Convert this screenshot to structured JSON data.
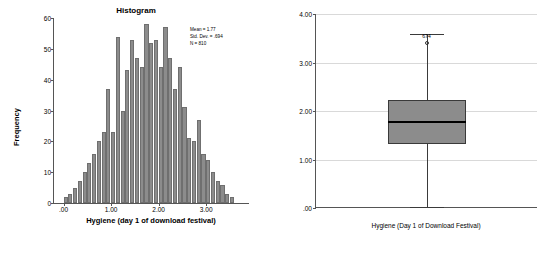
{
  "chart_data": [
    {
      "type": "bar",
      "name": "histogram",
      "title": "Histogram",
      "xlabel": "Hygiene (day 1 of download festival)",
      "ylabel": "Frequency",
      "xlim": [
        -0.2,
        3.9
      ],
      "ylim": [
        0,
        60
      ],
      "yticks": [
        "0",
        "10",
        "20",
        "30",
        "40",
        "50",
        "60"
      ],
      "ytickvals": [
        0,
        10,
        20,
        30,
        40,
        50,
        60
      ],
      "xticks": [
        ".00",
        "1.00",
        "2.00",
        "3.00"
      ],
      "xtickvals": [
        0,
        1,
        2,
        3
      ],
      "grid": false,
      "bin_width": 0.1,
      "bin_starts": [
        0.0,
        0.1,
        0.2,
        0.3,
        0.4,
        0.5,
        0.6,
        0.7,
        0.8,
        0.9,
        1.0,
        1.1,
        1.2,
        1.3,
        1.4,
        1.5,
        1.6,
        1.7,
        1.8,
        1.9,
        2.0,
        2.1,
        2.2,
        2.3,
        2.4,
        2.5,
        2.6,
        2.7,
        2.8,
        2.9,
        3.0,
        3.1,
        3.2,
        3.3,
        3.4,
        3.5
      ],
      "values": [
        2,
        3,
        5,
        7,
        10,
        13,
        16,
        20,
        23,
        37,
        23,
        54,
        30,
        43,
        53,
        47,
        44,
        58,
        52,
        53,
        44,
        57,
        47,
        37,
        44,
        31,
        21,
        20,
        27,
        16,
        14,
        10,
        7,
        6,
        3,
        2
      ],
      "annotations": {
        "mean": "Mean = 1.77",
        "std_dev": "Std. Dev. = .694",
        "n": "N = 810"
      }
    },
    {
      "type": "boxplot",
      "name": "boxplot",
      "xlabel": "Hygiene (Day 1 of Download Festival)",
      "ylim": [
        0,
        4
      ],
      "yticks": [
        "4.00",
        "3.00",
        "2.00",
        "1.00",
        ".00"
      ],
      "ytickvals": [
        4,
        3,
        2,
        1,
        0
      ],
      "grid": true,
      "box": {
        "whisker_low": 0.02,
        "q1": 1.32,
        "median": 1.79,
        "q3": 2.23,
        "whisker_high": 3.58
      },
      "outliers": [
        {
          "value": 3.41,
          "label": "674",
          "marker": "circle-open"
        }
      ]
    }
  ],
  "histogram": {
    "title": "Histogram",
    "xlabel": "Hygiene (day 1 of download festival)",
    "ylabel": "Frequency",
    "stats": {
      "mean": "Mean = 1.77",
      "std_dev": "Std. Dev. = .694",
      "n": "N = 810"
    }
  },
  "boxplot": {
    "xlabel": "Hygiene (Day 1 of Download Festival)",
    "outlier_label": "674"
  }
}
